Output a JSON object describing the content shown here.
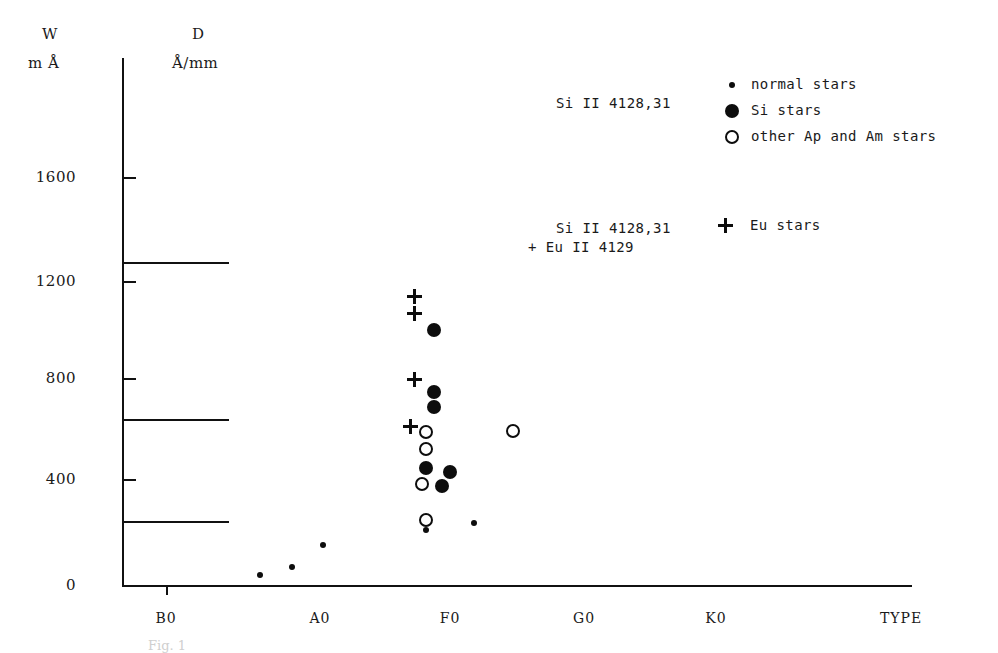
{
  "axes": {
    "y_title_line1": "W",
    "y_title_line2": "m Å",
    "d_title_line1": "D",
    "d_title_line2": "Å/mm",
    "x_axis_label": "TYPE",
    "y_ticks": [
      "1600",
      "1200",
      "800",
      "400",
      "0"
    ],
    "x_ticks": [
      "B0",
      "A0",
      "F0",
      "G0",
      "K0"
    ]
  },
  "legend": {
    "block1": {
      "lhs_label": "Si II 4128,31",
      "entries": [
        {
          "marker": "small-filled-circle",
          "label": "normal stars"
        },
        {
          "marker": "large-filled-circle",
          "label": "Si stars"
        },
        {
          "marker": "open-circle",
          "label": "other Ap and Am stars"
        }
      ]
    },
    "block2": {
      "lhs_line1": "Si II 4128,31",
      "lhs_line2": "+ Eu II 4129",
      "entries": [
        {
          "marker": "plus-sign",
          "label": "Eu stars"
        }
      ]
    }
  },
  "caption": "Fig. 1",
  "colors": {
    "ink": "#0d0d0d",
    "axis": "#111111",
    "background": "#ffffff"
  },
  "chart_data": {
    "type": "scatter",
    "title": "",
    "xlabel": "TYPE",
    "ylabel": "W  m Å",
    "xlim": [
      0,
      100
    ],
    "ylim": [
      0,
      1850
    ],
    "grid": false,
    "legend_position": "top-right",
    "y_axis_ticks": [
      0,
      400,
      800,
      1200,
      1600
    ],
    "x_axis_categories": [
      "B0",
      "A0",
      "F0",
      "G0",
      "K0"
    ],
    "x_category_positions": [
      14,
      37,
      54,
      71,
      86
    ],
    "secondary_axis": {
      "name": "D",
      "unit": "Å/mm",
      "description": "horizontal reference rules drawn from the W axis",
      "rule_W_values": [
        1270,
        650,
        250
      ]
    },
    "series": [
      {
        "name": "normal stars",
        "marker": "small-filled-circle",
        "points": [
          {
            "x": 17.5,
            "y": 40
          },
          {
            "x": 21.5,
            "y": 70
          },
          {
            "x": 25.5,
            "y": 155
          },
          {
            "x": 38.5,
            "y": 215
          },
          {
            "x": 44.5,
            "y": 245
          }
        ]
      },
      {
        "name": "Si stars",
        "marker": "large-filled-circle",
        "points": [
          {
            "x": 39.5,
            "y": 1000
          },
          {
            "x": 39.5,
            "y": 755
          },
          {
            "x": 39.5,
            "y": 700
          },
          {
            "x": 38.5,
            "y": 460
          },
          {
            "x": 41.5,
            "y": 445
          },
          {
            "x": 40.5,
            "y": 390
          }
        ]
      },
      {
        "name": "other Ap and Am stars",
        "marker": "open-circle",
        "points": [
          {
            "x": 38.5,
            "y": 600
          },
          {
            "x": 38.5,
            "y": 535
          },
          {
            "x": 38.0,
            "y": 395
          },
          {
            "x": 38.5,
            "y": 255
          },
          {
            "x": 49.5,
            "y": 605
          }
        ]
      },
      {
        "name": "Eu stars",
        "marker": "plus-sign",
        "points": [
          {
            "x": 37.0,
            "y": 1130
          },
          {
            "x": 37.0,
            "y": 1065
          },
          {
            "x": 37.0,
            "y": 805
          },
          {
            "x": 36.5,
            "y": 620
          }
        ]
      }
    ]
  }
}
